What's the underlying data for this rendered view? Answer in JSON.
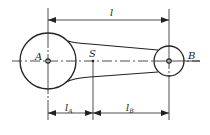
{
  "diagram": {
    "type": "connecting-rod",
    "points": {
      "A": {
        "label": "A",
        "x": 48,
        "y": 61
      },
      "S": {
        "label": "S",
        "x": 93,
        "y": 61
      },
      "B": {
        "label": "B",
        "x": 169,
        "y": 61
      }
    },
    "dimensions": {
      "l": {
        "label": "l"
      },
      "lA": {
        "label": "l",
        "sub": "A"
      },
      "lB": {
        "label": "l",
        "sub": "B"
      }
    },
    "colors": {
      "stroke": "#222222",
      "background": "#ffffff"
    }
  }
}
